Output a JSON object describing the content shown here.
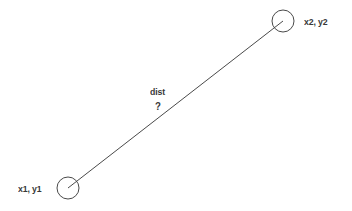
{
  "diagram": {
    "background_color": "#ffffff",
    "stroke_color": "#4a4a4a",
    "text_color": "#383838",
    "width": 352,
    "height": 211,
    "nodes": [
      {
        "id": "point1",
        "label": "x1, y1",
        "cx": 68,
        "cy": 188,
        "r": 11
      },
      {
        "id": "point2",
        "label": "x2, y2",
        "cx": 283,
        "cy": 21,
        "r": 11
      }
    ],
    "connector": {
      "id": "distance-line",
      "x1": 68,
      "y1": 188,
      "x2": 283,
      "y2": 21,
      "label": "dist",
      "value": "?"
    }
  }
}
